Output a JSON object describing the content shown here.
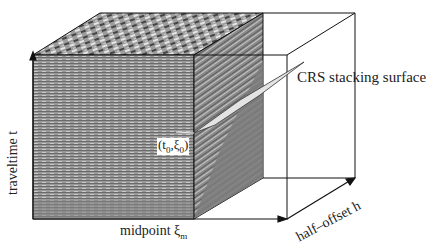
{
  "figure": {
    "type": "3D seismic data volume diagram",
    "labels": {
      "surface": "CRS stacking surface",
      "x_axis": "midpoint ξ",
      "x_axis_sub": "m",
      "y_axis": "traveltime  t",
      "z_axis": "half–offset  h",
      "point": "(t",
      "point_sub0": "0",
      "point_mid": ",ξ",
      "point_sub1": "0",
      "point_end": ")"
    },
    "colors": {
      "outline": "#111111",
      "surface_fill": "#e3e3e3",
      "data_face": "#8a8a8a",
      "side_face": "#7c7c7c",
      "background": "#ffffff"
    }
  }
}
